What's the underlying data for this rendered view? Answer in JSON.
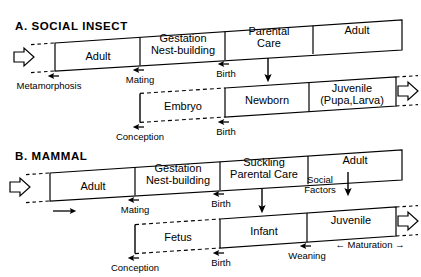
{
  "figure": {
    "type": "diagram",
    "background_color": "#ffffff",
    "line_color": "#000000"
  },
  "sections": [
    {
      "id": "A",
      "title": "A.  SOCIAL  INSECT",
      "upper_bar": {
        "name": "parent-generation-bar",
        "segments": [
          {
            "label": "Adult"
          },
          {
            "label": "Gestation\nNest-building",
            "line1": "Gestation",
            "line2": "Nest-building"
          },
          {
            "label": "Parental\nCare",
            "line1": "Parental",
            "line2": "Care"
          },
          {
            "label": "Adult"
          }
        ]
      },
      "lower_bar": {
        "name": "offspring-generation-bar",
        "segments": [
          {
            "label": "Embryo",
            "style": "dashed"
          },
          {
            "label": "Newborn",
            "style": "solid"
          },
          {
            "label": "Juvenile\n(Pupa,Larva)",
            "line1": "Juvenile",
            "line2": "(Pupa,Larva)",
            "style": "solid"
          }
        ]
      },
      "events_upper": [
        {
          "label": "Metamorphosis"
        },
        {
          "label": "Mating"
        },
        {
          "label": "Birth"
        }
      ],
      "events_lower": [
        {
          "label": "Conception"
        },
        {
          "label": "Birth"
        }
      ],
      "flow_arrows": [
        {
          "name": "inflow-arrow",
          "direction": "right"
        },
        {
          "name": "outflow-arrow",
          "direction": "right"
        },
        {
          "name": "parental-care-to-newborn-arrow",
          "direction": "down"
        }
      ]
    },
    {
      "id": "B",
      "title": "B.  MAMMAL",
      "upper_bar": {
        "name": "parent-generation-bar",
        "segments": [
          {
            "label": "Adult"
          },
          {
            "label": "Gestation\nNest-building",
            "line1": "Gestation",
            "line2": "Nest-building"
          },
          {
            "label": "Suckling\nParental Care",
            "line1": "Suckling",
            "line2": "Parental Care"
          },
          {
            "label": "Adult"
          }
        ]
      },
      "lower_bar": {
        "name": "offspring-generation-bar",
        "segments": [
          {
            "label": "Fetus",
            "style": "dashed"
          },
          {
            "label": "Infant",
            "style": "solid"
          },
          {
            "label": "Juvenile",
            "style": "solid"
          }
        ]
      },
      "events_upper": [
        {
          "label": "Mating"
        },
        {
          "label": "Birth"
        }
      ],
      "events_lower": [
        {
          "label": "Conception"
        },
        {
          "label": "Birth"
        },
        {
          "label": "Weaning"
        }
      ],
      "annotations": [
        {
          "label": "Social\nFactors",
          "line1": "Social",
          "line2": "Factors"
        },
        {
          "label": "← Maturation →"
        }
      ],
      "flow_arrows": [
        {
          "name": "inflow-arrow",
          "direction": "right"
        },
        {
          "name": "outflow-arrow",
          "direction": "right"
        },
        {
          "name": "progression-arrow",
          "direction": "right"
        },
        {
          "name": "suckling-to-infant-arrow",
          "direction": "down"
        },
        {
          "name": "social-factors-to-juvenile-arrow",
          "direction": "down"
        }
      ]
    }
  ]
}
